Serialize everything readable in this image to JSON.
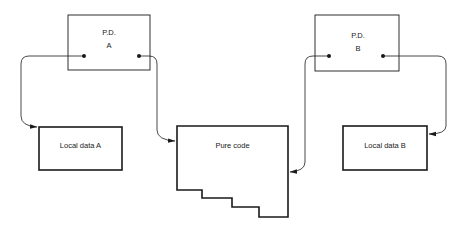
{
  "diagram": {
    "nodes": {
      "pd_a": {
        "line1": "P.D.",
        "line2": "A"
      },
      "pd_b": {
        "line1": "P.D.",
        "line2": "B"
      },
      "local_a": {
        "label": "Local data A"
      },
      "pure_code": {
        "label": "Pure code"
      },
      "local_b": {
        "label": "Local data B"
      }
    },
    "edges": [
      {
        "from": "pd_a (left pointer)",
        "to": "local_a"
      },
      {
        "from": "pd_a (right pointer)",
        "to": "pure_code"
      },
      {
        "from": "pd_b (left pointer)",
        "to": "pure_code"
      },
      {
        "from": "pd_b (right pointer)",
        "to": "local_b"
      }
    ],
    "colors": {
      "stroke": "#1a1a1a",
      "background": "#ffffff"
    }
  }
}
